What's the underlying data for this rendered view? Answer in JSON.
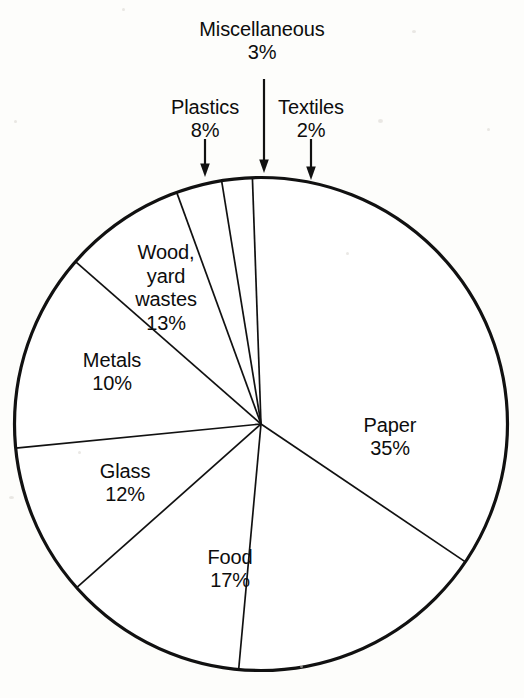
{
  "chart_data": {
    "type": "pie",
    "title": "",
    "subtitle": "",
    "xlabel": "",
    "ylabel": "",
    "units": "percent",
    "legend_position": "none",
    "grid": false,
    "total": 100,
    "categories": [
      "Paper",
      "Food",
      "Glass",
      "Metals",
      "Wood, yard wastes",
      "Plastics",
      "Miscellaneous",
      "Textiles"
    ],
    "values": [
      35,
      17,
      12,
      10,
      13,
      8,
      3,
      2
    ],
    "slices": [
      {
        "label": "Paper",
        "value": 35,
        "display": "35%",
        "label_placement": "inside",
        "line1": "Paper",
        "line2": "35%"
      },
      {
        "label": "Food",
        "value": 17,
        "display": "17%",
        "label_placement": "inside",
        "line1": "Food",
        "line2": "17%"
      },
      {
        "label": "Glass",
        "value": 12,
        "display": "12%",
        "label_placement": "inside",
        "line1": "Glass",
        "line2": "12%"
      },
      {
        "label": "Metals",
        "value": 10,
        "display": "10%",
        "label_placement": "inside",
        "line1": "Metals",
        "line2": "10%"
      },
      {
        "label": "Wood, yard wastes",
        "value": 13,
        "display": "13%",
        "label_placement": "inside",
        "line1": "Wood,",
        "line2": "yard",
        "line3": "wastes",
        "line4": "13%"
      },
      {
        "label": "Plastics",
        "value": 8,
        "display": "8%",
        "label_placement": "outside",
        "line1": "Plastics",
        "line2": "8%"
      },
      {
        "label": "Miscellaneous",
        "value": 3,
        "display": "3%",
        "label_placement": "outside",
        "line1": "Miscellaneous",
        "line2": "3%"
      },
      {
        "label": "Textiles",
        "value": 2,
        "display": "2%",
        "label_placement": "outside",
        "line1": "Textiles",
        "line2": "2%"
      }
    ],
    "colors": {
      "slice_fill": "#ffffff",
      "outline": "#111111",
      "text": "#0d0d0d",
      "background": "#fdfdfb"
    }
  },
  "labels": {
    "miscellaneous": {
      "name": "Miscellaneous",
      "pct": "3%"
    },
    "plastics": {
      "name": "Plastics",
      "pct": "8%"
    },
    "textiles": {
      "name": "Textiles",
      "pct": "2%"
    },
    "wood": {
      "l1": "Wood,",
      "l2": "yard",
      "l3": "wastes",
      "pct": "13%"
    },
    "metals": {
      "name": "Metals",
      "pct": "10%"
    },
    "glass": {
      "name": "Glass",
      "pct": "12%"
    },
    "food": {
      "name": "Food",
      "pct": "17%"
    },
    "paper": {
      "name": "Paper",
      "pct": "35%"
    }
  }
}
